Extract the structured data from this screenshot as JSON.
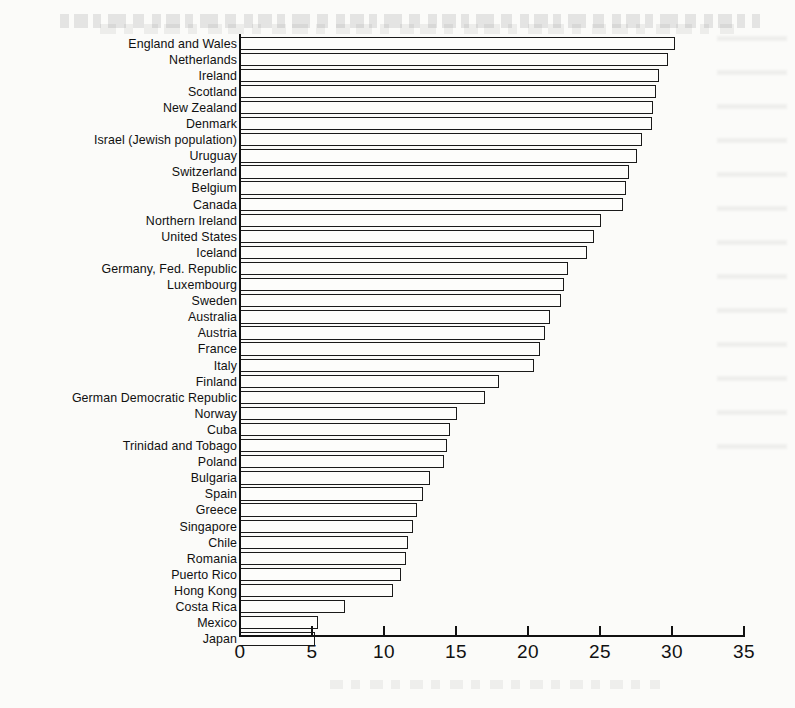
{
  "chart_data": {
    "type": "bar",
    "orientation": "horizontal",
    "title": "",
    "xlabel": "",
    "ylabel": "",
    "xlim": [
      0,
      35
    ],
    "xticks": [
      0,
      5,
      10,
      15,
      20,
      25,
      30,
      35
    ],
    "xtick_labels": [
      "0",
      "5",
      "10",
      "15",
      "20",
      "25",
      "30",
      "35"
    ],
    "grid": false,
    "legend": null,
    "categories": [
      "England and Wales",
      "Netherlands",
      "Ireland",
      "Scotland",
      "New Zealand",
      "Denmark",
      "Israel (Jewish population)",
      "Uruguay",
      "Switzerland",
      "Belgium",
      "Canada",
      "Northern Ireland",
      "United States",
      "Iceland",
      "Germany, Fed. Republic",
      "Luxembourg",
      "Sweden",
      "Australia",
      "Austria",
      "France",
      "Italy",
      "Finland",
      "German Democratic Republic",
      "Norway",
      "Cuba",
      "Trinidad and Tobago",
      "Poland",
      "Bulgaria",
      "Spain",
      "Greece",
      "Singapore",
      "Chile",
      "Romania",
      "Puerto Rico",
      "Hong Kong",
      "Costa Rica",
      "Mexico",
      "Japan"
    ],
    "values": [
      30.2,
      29.7,
      29.1,
      28.9,
      28.7,
      28.6,
      27.9,
      27.6,
      27.0,
      26.8,
      26.6,
      25.1,
      24.6,
      24.1,
      22.8,
      22.5,
      22.3,
      21.5,
      21.2,
      20.8,
      20.4,
      18.0,
      17.0,
      15.1,
      14.6,
      14.4,
      14.2,
      13.2,
      12.7,
      12.3,
      12.0,
      11.7,
      11.5,
      11.2,
      10.6,
      7.3,
      5.4,
      5.2
    ]
  }
}
